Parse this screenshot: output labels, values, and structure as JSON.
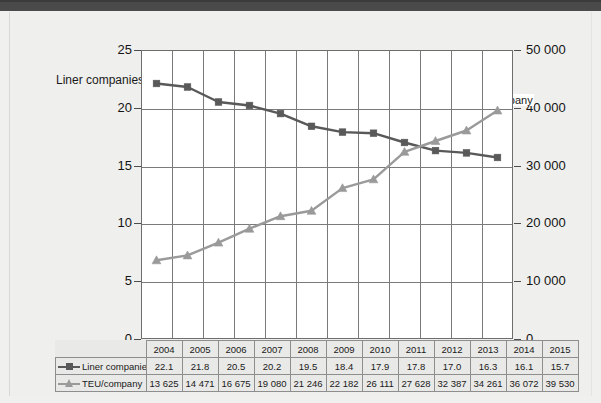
{
  "page": {
    "background_color": "#efefed",
    "top_band_color": "#4a4a4a"
  },
  "chart_data": {
    "type": "line",
    "title": "",
    "subtitle": "",
    "xlabel": "",
    "ylabel": "",
    "grid": true,
    "legend_position": "in-table",
    "categories": [
      "2004",
      "2005",
      "2006",
      "2007",
      "2008",
      "2009",
      "2010",
      "2011",
      "2012",
      "2013",
      "2014",
      "2015"
    ],
    "series": [
      {
        "name": "Liner companies",
        "axis": "left",
        "color": "#595959",
        "marker": "square",
        "values": [
          22.1,
          21.8,
          20.5,
          20.2,
          19.5,
          18.4,
          17.9,
          17.8,
          17.0,
          16.3,
          16.1,
          15.7
        ],
        "value_labels": [
          "22.1",
          "21.8",
          "20.5",
          "20.2",
          "19.5",
          "18.4",
          "17.9",
          "17.8",
          "17.0",
          "16.3",
          "16.1",
          "15.7"
        ],
        "annotation": "Liner companies"
      },
      {
        "name": "TEU/company",
        "axis": "right",
        "color": "#9a9a9a",
        "marker": "triangle",
        "values": [
          13625,
          14471,
          16675,
          19080,
          21246,
          22182,
          26111,
          27628,
          32387,
          34261,
          36072,
          39530
        ],
        "value_labels": [
          "13 625",
          "14 471",
          "16 675",
          "19 080",
          "21 246",
          "22 182",
          "26 111",
          "27 628",
          "32 387",
          "34 261",
          "36 072",
          "39 530"
        ],
        "annotation": "TEU/company"
      }
    ],
    "left_axis": {
      "label": "",
      "ylim": [
        0,
        25
      ],
      "ticks": [
        0,
        5,
        10,
        15,
        20,
        25
      ],
      "tick_labels": [
        "0",
        "5",
        "10",
        "15",
        "20",
        "25"
      ]
    },
    "right_axis": {
      "label": "",
      "ylim": [
        0,
        50000
      ],
      "ticks": [
        0,
        10000,
        20000,
        30000,
        40000,
        50000
      ],
      "tick_labels": [
        "0",
        "10 000",
        "20 000",
        "30 000",
        "40 000",
        "50 000"
      ]
    }
  },
  "table": {
    "header_row": [
      "2004",
      "2005",
      "2006",
      "2007",
      "2008",
      "2009",
      "2010",
      "2011",
      "2012",
      "2013",
      "2014",
      "2015"
    ],
    "rows": [
      {
        "label": "Liner companies",
        "marker": "square",
        "color": "#595959",
        "cells": [
          "22.1",
          "21.8",
          "20.5",
          "20.2",
          "19.5",
          "18.4",
          "17.9",
          "17.8",
          "17.0",
          "16.3",
          "16.1",
          "15.7"
        ]
      },
      {
        "label": "TEU/company",
        "marker": "triangle",
        "color": "#9a9a9a",
        "cells": [
          "13 625",
          "14 471",
          "16 675",
          "19 080",
          "21 246",
          "22 182",
          "26 111",
          "27 628",
          "32 387",
          "34 261",
          "36 072",
          "39 530"
        ]
      }
    ]
  }
}
